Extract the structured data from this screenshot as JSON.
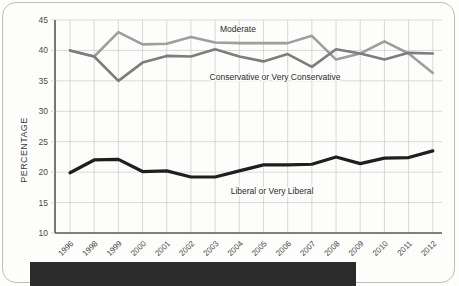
{
  "page": {
    "background_color": "#fdfdfb",
    "border_color": "#bdbdbd",
    "bottom_bar_color": "#2b2b2b"
  },
  "chart_data": {
    "type": "line",
    "title": "",
    "xlabel": "",
    "ylabel": "PERCENTAGE",
    "ylim": [
      10,
      45
    ],
    "yticks": [
      10,
      15,
      20,
      25,
      30,
      35,
      40,
      45
    ],
    "grid": true,
    "legend_position": "inline-labels",
    "categories": [
      "1996",
      "1998",
      "1999",
      "2000",
      "2001",
      "2002",
      "2003",
      "2004",
      "2005",
      "2006",
      "2007",
      "2008",
      "2009",
      "2010",
      "2011",
      "2012"
    ],
    "series": [
      {
        "name": "Moderate",
        "color": "#9e9e9e",
        "label_x_category": "2005",
        "values": [
          40.0,
          39.0,
          43.0,
          41.0,
          41.1,
          42.2,
          41.3,
          41.2,
          41.2,
          41.2,
          42.4,
          38.5,
          39.5,
          41.5,
          39.5,
          36.3
        ]
      },
      {
        "name": "Conservative or Very Conservative",
        "color": "#7d7d7d",
        "label_x_category": "2004",
        "values": [
          40.0,
          39.0,
          35.0,
          38.0,
          39.1,
          39.0,
          40.2,
          39.0,
          38.2,
          39.4,
          37.3,
          40.2,
          39.5,
          38.5,
          39.6,
          39.5
        ]
      },
      {
        "name": "Liberal or Very Liberal",
        "color": "#1f1f1f",
        "label_x_category": "2004",
        "values": [
          19.9,
          22.0,
          22.1,
          20.1,
          20.2,
          19.2,
          19.2,
          20.2,
          21.2,
          21.2,
          21.3,
          22.5,
          21.4,
          22.3,
          22.4,
          23.5
        ]
      }
    ],
    "series_labels": [
      {
        "text": "Moderate",
        "x": 238,
        "y": 32
      },
      {
        "text": "Conservative or Very Conservative",
        "x": 275,
        "y": 80
      },
      {
        "text": "Liberal or Very Liberal",
        "x": 272,
        "y": 194
      }
    ]
  }
}
